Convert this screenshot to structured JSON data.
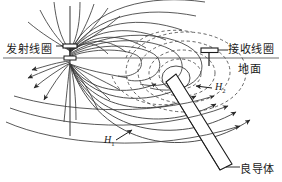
{
  "figure": {
    "name": "electromagnetic-induction-prospecting-diagram",
    "type": "schematic-diagram",
    "background_color": "#ffffff",
    "line_color": "#1a1a1a",
    "field_line_color": "#3b3b3b",
    "secondary_field_color": "#4a4a4a"
  },
  "labels": {
    "transmitter_coil": "发射线圈",
    "receiver_coil": "接收线圈",
    "ground_surface": "地面",
    "conductor": "良导体",
    "primary_field": "H",
    "primary_field_sub": "1",
    "secondary_field": "H",
    "secondary_field_sub": "2"
  },
  "elements": {
    "transmitter_coil_symbol": "vertical-coil-bar",
    "receiver_coil_symbol": "horizontal-coil-bar-on-stem",
    "conductor_symbol": "dipping-tabular-conductor",
    "axis_vertical": "dipole-axis",
    "axis_horizontal": "ground-line",
    "primary_field_style": "solid",
    "secondary_field_style": "dashed"
  }
}
